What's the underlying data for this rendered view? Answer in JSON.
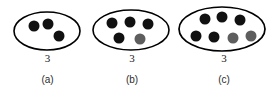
{
  "figure": {
    "background_color": "#ffffff",
    "outline_color": "#000000",
    "dot_colors": {
      "black": "#111111",
      "gray": "#5e5e5e"
    },
    "groups": [
      {
        "id": "group-a",
        "count_label": "3",
        "caption": "(a)",
        "ellipse": {
          "cx": 47,
          "cy": 31,
          "rx": 33,
          "ry": 19
        },
        "dots": [
          {
            "cx": 34,
            "cy": 26,
            "r": 5.5,
            "color": "black"
          },
          {
            "cx": 48,
            "cy": 24,
            "r": 5.5,
            "color": "black"
          },
          {
            "cx": 59,
            "cy": 36,
            "r": 5.5,
            "color": "black"
          }
        ]
      },
      {
        "id": "group-b",
        "count_label": "3",
        "caption": "(b)",
        "ellipse": {
          "cx": 131,
          "cy": 30,
          "rx": 38,
          "ry": 20
        },
        "dots": [
          {
            "cx": 112,
            "cy": 23,
            "r": 5.5,
            "color": "black"
          },
          {
            "cx": 130,
            "cy": 22,
            "r": 5.5,
            "color": "black"
          },
          {
            "cx": 148,
            "cy": 24,
            "r": 5.5,
            "color": "black"
          },
          {
            "cx": 119,
            "cy": 38,
            "r": 5.5,
            "color": "black"
          },
          {
            "cx": 140,
            "cy": 39,
            "r": 5.5,
            "color": "gray"
          }
        ]
      },
      {
        "id": "group-c",
        "count_label": "3",
        "caption": "(c)",
        "ellipse": {
          "cx": 222,
          "cy": 29,
          "rx": 43,
          "ry": 22
        },
        "dots": [
          {
            "cx": 205,
            "cy": 19,
            "r": 5.5,
            "color": "black"
          },
          {
            "cx": 222,
            "cy": 17,
            "r": 5.5,
            "color": "black"
          },
          {
            "cx": 240,
            "cy": 20,
            "r": 5.5,
            "color": "black"
          },
          {
            "cx": 196,
            "cy": 36,
            "r": 5.5,
            "color": "black"
          },
          {
            "cx": 214,
            "cy": 37,
            "r": 5.5,
            "color": "black"
          },
          {
            "cx": 233,
            "cy": 38,
            "r": 5.5,
            "color": "gray"
          },
          {
            "cx": 251,
            "cy": 36,
            "r": 5.5,
            "color": "gray"
          }
        ]
      }
    ],
    "label_rows": {
      "count_y": 54,
      "caption_y": 76
    }
  }
}
